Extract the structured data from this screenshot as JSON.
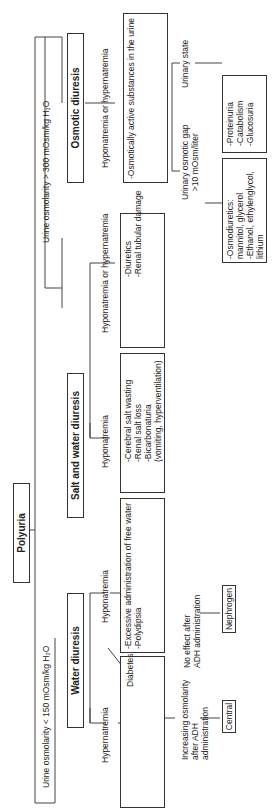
{
  "root": {
    "label": "Polyuria"
  },
  "branches": {
    "low_osm": "Urine osmolarity < 150 mOsm/kg H₂O",
    "high_osm": "Urine osmolarity > 300 mOsm/kg H₂O"
  },
  "water_diuresis": {
    "title": "Water diuresis",
    "hyper": "Hypernatremia",
    "hypo": "Hyponatremia",
    "di_box": "Diabetes insipidus",
    "hypo_box": "-Excessive administration of free water\n-Polydipsia",
    "adh_yes": "Increasing osmolarity\nafter ADH\nadministration",
    "adh_no": "No effect after\nADH administration",
    "central": "Central",
    "nephrogen": "Nephrogen"
  },
  "salt_water_diuresis": {
    "title": "Salt and water diuresis",
    "hypo": "Hyponatremia",
    "hypo_or_hyper": "Hyponatremia or hypernatremia",
    "hypo_box": "-Cerebral salt wasting\n-Renal salt loss\n-Bicarbonaturia\n(vomiting, hyperventilation)",
    "hh_box": "-Diuretics\n-Renal tubular damage"
  },
  "osmotic_diuresis": {
    "title": "Osmotic diuresis",
    "hypo_or_hyper": "Hyponatremia or hypernatremia",
    "box": "-Osmotically active substances in the urine",
    "gap": "Urinary osmotic gap\n>10 mOsm/liter",
    "state": "Urinary state",
    "gap_box": "-Osmodiuretics:\nmannitol, glycerol\n-Ethanol, ethylenglycol,\nlithium",
    "state_box": "-Proteinuria\n-Catabolism\n-Glucosuria"
  }
}
